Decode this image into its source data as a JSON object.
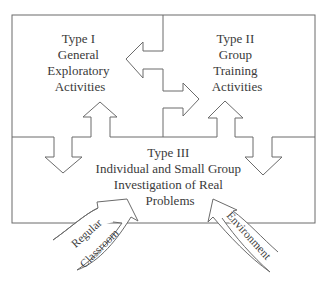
{
  "diagram": {
    "colors": {
      "line": "#6b6b6b",
      "text": "#3a3a3a",
      "background": "#ffffff"
    },
    "type1": {
      "lines": [
        "Type I",
        "General",
        "Exploratory",
        "Activities"
      ]
    },
    "type2": {
      "lines": [
        "Type II",
        "Group",
        "Training",
        "Activities"
      ]
    },
    "type3": {
      "lines": [
        "Type III",
        "Individual and Small Group",
        "Investigation of Real",
        "Problems"
      ]
    },
    "inputs": {
      "left": {
        "lines": [
          "Regular",
          "Classroom"
        ]
      },
      "right": {
        "label": "Environment"
      }
    }
  }
}
